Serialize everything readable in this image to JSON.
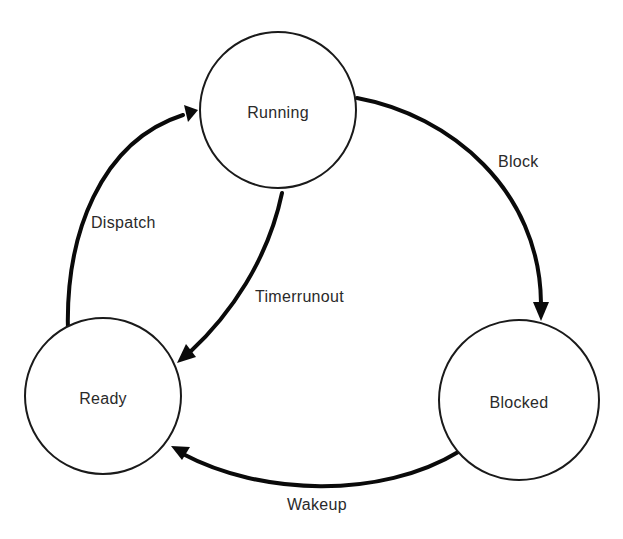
{
  "diagram": {
    "type": "state-transition",
    "colors": {
      "stroke": "#0a0a0a",
      "circle_stroke": "#1a1a1a",
      "text": "#2a2a2a",
      "background": "#ffffff"
    },
    "states": [
      {
        "id": "running",
        "label": "Running",
        "cx": 278,
        "cy": 110,
        "r": 78
      },
      {
        "id": "ready",
        "label": "Ready",
        "cx": 103,
        "cy": 396,
        "r": 78
      },
      {
        "id": "blocked",
        "label": "Blocked",
        "cx": 519,
        "cy": 400,
        "r": 80
      }
    ],
    "transitions": [
      {
        "id": "block",
        "label": "Block",
        "from": "running",
        "to": "blocked"
      },
      {
        "id": "dispatch",
        "label": "Dispatch",
        "from": "ready",
        "to": "running"
      },
      {
        "id": "timerrunout",
        "label": "Timerrunout",
        "from": "running",
        "to": "ready"
      },
      {
        "id": "wakeup",
        "label": "Wakeup",
        "from": "blocked",
        "to": "ready"
      }
    ]
  }
}
